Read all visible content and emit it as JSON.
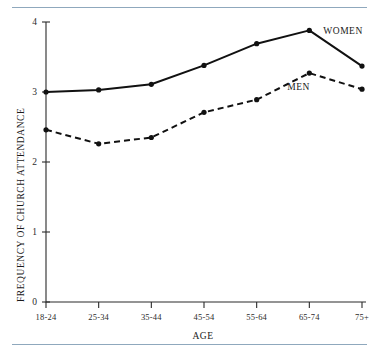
{
  "chart_data": {
    "type": "line",
    "title": "",
    "xlabel": "AGE",
    "ylabel": "FREQUENCY OF CHURCH ATTENDANCE",
    "categories": [
      "18-24",
      "25-34",
      "35-44",
      "45-54",
      "55-64",
      "65-74",
      "75+"
    ],
    "ylim": [
      0,
      4
    ],
    "yticks": [
      0,
      1,
      2,
      3,
      4
    ],
    "ytick_labels": [
      "0",
      "1",
      "2",
      "3",
      "4"
    ],
    "grid": false,
    "legend_position": "inline-right",
    "series": [
      {
        "name": "WOMEN",
        "style": "solid",
        "marker": "filled-circle",
        "values": [
          3.0,
          3.03,
          3.11,
          3.38,
          3.69,
          3.88,
          3.37
        ]
      },
      {
        "name": "MEN",
        "style": "dashed",
        "marker": "filled-circle",
        "values": [
          2.46,
          2.26,
          2.35,
          2.71,
          2.89,
          3.27,
          3.04
        ]
      }
    ],
    "annotations": [
      {
        "text": "WOMEN",
        "series": "WOMEN"
      },
      {
        "text": "MEN",
        "series": "MEN"
      }
    ],
    "colors": {
      "line": "#111111",
      "axis": "#2b2b2b",
      "rule": "#8fa8bd",
      "background": "#ffffff"
    }
  }
}
